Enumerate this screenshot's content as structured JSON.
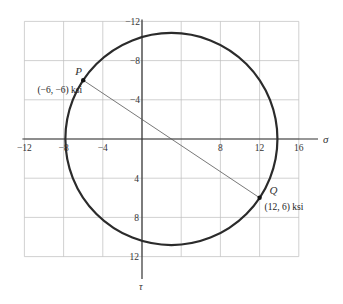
{
  "diagram": {
    "type": "mohr_circle",
    "axes": {
      "x_label": "σ",
      "y_label": "τ",
      "x_ticks": [
        "-12",
        "-8",
        "-4",
        "8",
        "12",
        "16"
      ],
      "x_tick_values": [
        -12,
        -8,
        -4,
        8,
        12,
        16
      ],
      "y_ticks_up": [
        "-12",
        "-8",
        "-4"
      ],
      "y_ticks_up_values": [
        -12,
        -8,
        -4
      ],
      "y_ticks_down": [
        "4",
        "8",
        "12"
      ],
      "y_ticks_down_values": [
        4,
        8,
        12
      ],
      "x_range": [
        -12,
        16
      ],
      "y_range": [
        -12,
        12
      ],
      "y_direction": "positive downward",
      "grid_step": 4
    },
    "circle": {
      "center": [
        3,
        0
      ],
      "radius": 10.82
    },
    "points": [
      {
        "name": "P",
        "coords": [
          -6,
          -6
        ],
        "label": "(−6, −6) ksi"
      },
      {
        "name": "Q",
        "coords": [
          12,
          6
        ],
        "label": "(12, 6) ksi"
      }
    ],
    "colors": {
      "circle": "#2b2b2b",
      "grid": "#bdbdbd",
      "axis": "#333333",
      "diameter_line": "#555555"
    }
  }
}
